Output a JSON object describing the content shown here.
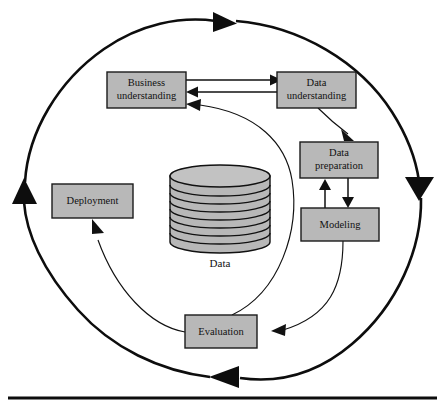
{
  "figure": {
    "width": 445,
    "height": 413
  },
  "colors": {
    "box_fill": "#b8b8b8",
    "box_stroke": "#1a1a1a",
    "ring_stroke": "#0d0d0d",
    "arrow_stroke": "#111111",
    "background": "#ffffff",
    "text": "#111111"
  },
  "phases": [
    {
      "id": "business-understanding",
      "line1": "Business",
      "line2": "understanding",
      "x": 107,
      "y": 72,
      "w": 79,
      "h": 36
    },
    {
      "id": "data-understanding",
      "line1": "Data",
      "line2": "understanding",
      "x": 277,
      "y": 72,
      "w": 79,
      "h": 36
    },
    {
      "id": "data-preparation",
      "line1": "Data",
      "line2": "preparation",
      "x": 300,
      "y": 142,
      "w": 78,
      "h": 36
    },
    {
      "id": "modeling",
      "line1": "Modeling",
      "line2": "",
      "x": 301,
      "y": 208,
      "w": 78,
      "h": 33
    },
    {
      "id": "deployment",
      "line1": "Deployment",
      "line2": "",
      "x": 52,
      "y": 184,
      "w": 81,
      "h": 34
    },
    {
      "id": "evaluation",
      "line1": "Evaluation",
      "line2": "",
      "x": 185,
      "y": 315,
      "w": 72,
      "h": 33
    }
  ],
  "data_store": {
    "label": "Data",
    "disc_count": 8,
    "center_x": 220,
    "top_y": 176,
    "radius_x": 50,
    "radius_y": 11,
    "body_height": 66
  },
  "outer_cycle": {
    "direction": "clockwise",
    "arrowheads": [
      {
        "id": "top-arrowhead",
        "position": "top",
        "points": "right"
      },
      {
        "id": "right-arrowhead",
        "position": "right",
        "points": "down"
      },
      {
        "id": "bottom-arrowhead",
        "position": "bottom",
        "points": "left"
      },
      {
        "id": "left-arrowhead",
        "position": "left",
        "points": "up"
      }
    ]
  },
  "connections": [
    {
      "id": "business-to-data-understanding",
      "from": "business-understanding",
      "to": "data-understanding",
      "kind": "straight"
    },
    {
      "id": "data-to-business-understanding",
      "from": "data-understanding",
      "to": "business-understanding",
      "kind": "straight"
    },
    {
      "id": "data-understanding-to-data-preparation",
      "from": "data-understanding",
      "to": "data-preparation",
      "kind": "curved"
    },
    {
      "id": "data-preparation-to-modeling",
      "from": "data-preparation",
      "to": "modeling",
      "kind": "straight"
    },
    {
      "id": "modeling-to-data-preparation",
      "from": "modeling",
      "to": "data-preparation",
      "kind": "straight"
    },
    {
      "id": "modeling-to-evaluation",
      "from": "modeling",
      "to": "evaluation",
      "kind": "curved"
    },
    {
      "id": "evaluation-to-business-understanding",
      "from": "evaluation",
      "to": "business-understanding",
      "kind": "curved"
    },
    {
      "id": "evaluation-to-deployment",
      "from": "evaluation",
      "to": "deployment",
      "kind": "curved"
    }
  ],
  "baseline": {
    "id": "bottom-rule",
    "y": 398
  }
}
